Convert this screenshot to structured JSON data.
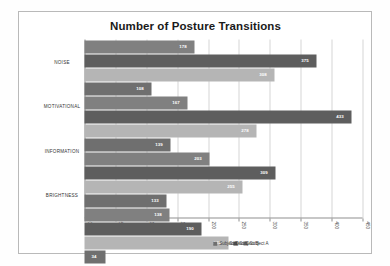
{
  "figure": {
    "rotation_degrees": 90,
    "background": "#ffffff",
    "frame_color": "#b9b9b9"
  },
  "chart_data": {
    "type": "bar",
    "title": "",
    "xlabel": "",
    "ylabel": "Number of Posture Transitions",
    "categories": [
      "NOISE",
      "MOTIVATIONAL",
      "INFORMATION",
      "BRIGHTNESS"
    ],
    "series": [
      {
        "name": "Subject A",
        "color": "#808080",
        "values": [
          178,
          167,
          203,
          138
        ]
      },
      {
        "name": "Subject B",
        "color": "#5e5e5e",
        "values": [
          375,
          433,
          309,
          190
        ]
      },
      {
        "name": "Subject C",
        "color": "#b5b5b5",
        "values": [
          308,
          278,
          255,
          233
        ]
      },
      {
        "name": "Subject D",
        "color": "#6f6f6f",
        "values": [
          108,
          139,
          133,
          34
        ]
      }
    ],
    "ylim": [
      0,
      450
    ],
    "yticks": [
      0,
      50,
      100,
      150,
      200,
      250,
      300,
      350,
      400,
      450
    ],
    "ytick_labels": [
      "0",
      "50",
      "100",
      "150",
      "200",
      "250",
      "300",
      "350",
      "400",
      "450"
    ],
    "grid": true,
    "legend_position": "right",
    "data_labels": true
  }
}
